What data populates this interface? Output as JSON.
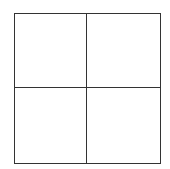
{
  "diagram": {
    "type": "grid",
    "rows": 2,
    "columns": 2,
    "line_color": "#333333",
    "background_color": "#ffffff",
    "cells": [
      {
        "row": 0,
        "col": 0,
        "label": ""
      },
      {
        "row": 0,
        "col": 1,
        "label": ""
      },
      {
        "row": 1,
        "col": 0,
        "label": ""
      },
      {
        "row": 1,
        "col": 1,
        "label": ""
      }
    ]
  }
}
